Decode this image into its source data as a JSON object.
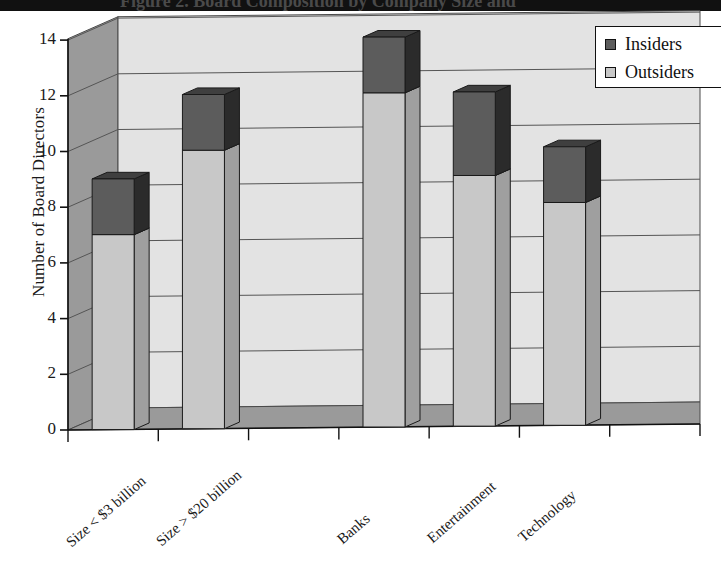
{
  "title": {
    "text": "Figure 2. Board Composition by Company Size and",
    "cut_off": true
  },
  "legend": {
    "position": "top-right",
    "items": [
      {
        "label": "Insiders",
        "color": "#5c5c5c",
        "name": "legend-item-insiders"
      },
      {
        "label": "Outsiders",
        "color": "#c8c8c8",
        "name": "legend-item-outsiders"
      }
    ]
  },
  "axes": {
    "ylabel": "Number of Board Directors",
    "yticks": [
      "14",
      "12",
      "10",
      "8",
      "6",
      "4",
      "2",
      "0"
    ],
    "xlabels": [
      "Size < $3 billion",
      "Size > $20 billion",
      "Banks",
      "Entertainment",
      "Technology"
    ]
  },
  "chart_data": {
    "type": "bar",
    "subtype": "stacked-column-3d",
    "title": "Figure 2. Board Composition by Company Size and",
    "xlabel": "",
    "ylabel": "Number of Board Directors",
    "ylim": [
      0,
      14
    ],
    "ytick_step": 2,
    "grid": true,
    "legend_position": "top-right",
    "categories": [
      "Size < $3 billion",
      "Size > $20 billion",
      "Banks",
      "Entertainment",
      "Technology"
    ],
    "series": [
      {
        "name": "Outsiders",
        "color": "#c8c8c8",
        "values": [
          7,
          10,
          12,
          9,
          8
        ]
      },
      {
        "name": "Insiders",
        "color": "#5c5c5c",
        "values": [
          2,
          2,
          2,
          3,
          2
        ]
      }
    ],
    "totals": [
      9,
      12,
      14,
      12,
      10
    ]
  },
  "colors": {
    "plot_background": "#e3e3e3",
    "floor": "#9a9a9a",
    "outsiders_front": "#c8c8c8",
    "outsiders_side": "#9f9f9f",
    "outsiders_top": "#ededed",
    "insiders_front": "#5c5c5c",
    "insiders_side": "#2b2b2b",
    "insiders_top": "#3f3f3f",
    "gridline": "#555555",
    "axis": "#111111"
  }
}
